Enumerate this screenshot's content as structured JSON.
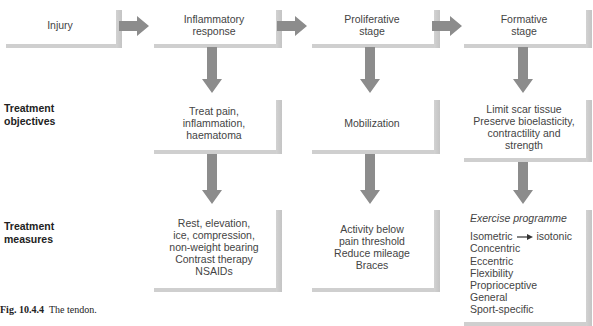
{
  "diagram": {
    "stages": [
      {
        "id": "injury",
        "label": "Injury"
      },
      {
        "id": "inflammatory",
        "label": "Inflammatory\nresponse"
      },
      {
        "id": "proliferative",
        "label": "Proliferative\nstage"
      },
      {
        "id": "formative",
        "label": "Formative\nstage"
      }
    ],
    "row_labels": {
      "objectives": "Treatment\nobjectives",
      "measures": "Treatment\nmeasures"
    },
    "objectives": {
      "inflammatory": "Treat pain,\ninflammation,\nhaematoma",
      "proliferative": "Mobilization",
      "formative": "Limit scar tissue\nPreserve bioelasticity,\ncontractility and\nstrength"
    },
    "measures": {
      "inflammatory": "Rest, elevation,\nice, compression,\nnon-weight bearing\nContrast therapy\nNSAIDs",
      "proliferative": "Activity below\npain threshold\nReduce mileage\nBraces",
      "formative": {
        "title": "Exercise programme",
        "progression_from": "Isometric",
        "progression_to": "isotonic",
        "items": [
          "Concentric",
          "Eccentric",
          "Flexibility",
          "Proprioceptive",
          "General",
          "Sport-specific"
        ]
      }
    },
    "caption": {
      "number": "Fig. 10.4.4",
      "text": "The tendon."
    },
    "colors": {
      "arrow": "#8c8c8c",
      "shadow": "#c8c8c8",
      "box": "#ffffff"
    }
  }
}
